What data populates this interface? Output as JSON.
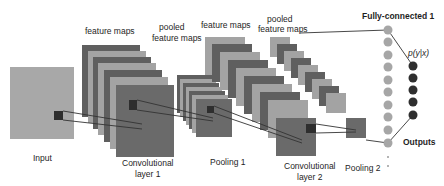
{
  "diagram": {
    "colors": {
      "background": "#ffffff",
      "input": "#a8a8a8",
      "map_dark": "#5f5f5f",
      "map_light": "#a3a3a3",
      "map_front": "#6a6a6a",
      "kernel": "#2e2e2e",
      "fc_neuron": "#a6a6a6",
      "output_neuron": "#2f2f2f",
      "line": "#333333"
    },
    "labels": {
      "input": "Input",
      "feature_maps_1": "feature maps",
      "pooled_1_line1": "pooled",
      "pooled_1_line2": "feature maps",
      "feature_maps_2": "feature maps",
      "pooled_2_line1": "pooled",
      "pooled_2_line2": "feature maps",
      "fully_connected": "Fully-connected 1",
      "probability": "p(y|x)",
      "outputs": "Outputs",
      "conv1_line1": "Convolutional",
      "conv1_line2": "layer 1",
      "pool1": "Pooling 1",
      "conv2_line1": "Convolutional",
      "conv2_line2": "layer 2",
      "pool2": "Pooling 2"
    },
    "stages": [
      {
        "name": "Input",
        "maps": 1
      },
      {
        "name": "Convolutional layer 1",
        "maps": 7
      },
      {
        "name": "Pooling 1",
        "maps": 7
      },
      {
        "name": "Convolutional layer 2",
        "maps": 10
      },
      {
        "name": "Pooling 2",
        "maps": 10
      },
      {
        "name": "Fully-connected 1",
        "neurons_visible": 10
      },
      {
        "name": "Outputs",
        "neurons_visible": 5
      }
    ]
  }
}
